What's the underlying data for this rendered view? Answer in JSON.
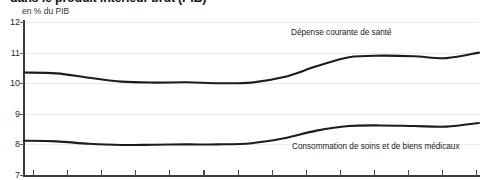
{
  "header": {
    "title": "dans le produit intérieur brut (PIB)",
    "subtitle": "en % du PIB"
  },
  "chart_data": {
    "type": "line",
    "title": "dans le produit intérieur brut (PIB)",
    "subtitle": "en % du PIB",
    "xlabel": "",
    "ylabel": "en % du PIB",
    "ylim": [
      7,
      12
    ],
    "yticks": [
      7,
      8,
      9,
      10,
      11,
      12
    ],
    "ytick_labels": [
      "7",
      "8",
      "9",
      "10",
      "11",
      "12"
    ],
    "grid": true,
    "legend_position": "inline-above-series",
    "xtick_count": 14,
    "x": [
      0,
      1,
      2,
      3,
      4,
      5,
      6,
      7,
      8,
      9,
      10,
      11,
      12,
      13,
      14
    ],
    "series": [
      {
        "name": "Dépense courante de santé",
        "values": [
          10.35,
          10.32,
          10.18,
          10.05,
          10.02,
          10.03,
          10.0,
          10.02,
          10.2,
          10.55,
          10.85,
          10.9,
          10.88,
          10.82,
          11.0
        ]
      },
      {
        "name": "Consommation de soins et de biens médicaux",
        "values": [
          8.12,
          8.1,
          8.02,
          7.98,
          7.99,
          8.0,
          8.0,
          8.04,
          8.2,
          8.45,
          8.6,
          8.62,
          8.6,
          8.58,
          8.7
        ]
      }
    ],
    "annotations": [
      {
        "text": "Dépense courante de santé",
        "series": 0
      },
      {
        "text": "Consommation de soins et de biens médicaux",
        "series": 1
      }
    ]
  },
  "axis": {
    "y_labels": [
      "12",
      "11",
      "10",
      "9",
      "8",
      "7"
    ]
  }
}
